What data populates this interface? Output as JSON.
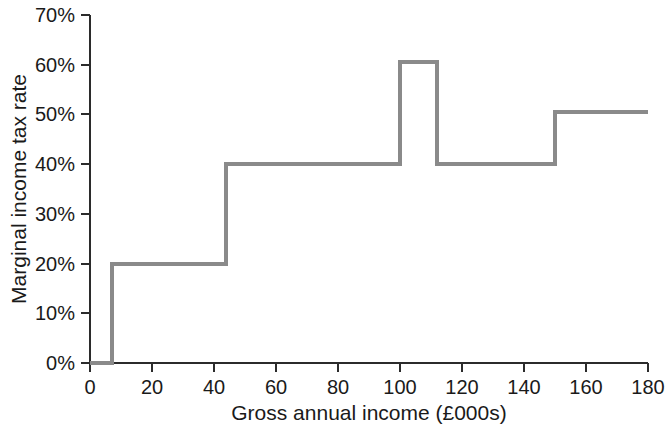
{
  "chart_data": {
    "type": "line",
    "subtype": "step",
    "title": "",
    "xlabel": "Gross annual income (£000s)",
    "ylabel": "Marginal income tax rate",
    "xlim": [
      0,
      180
    ],
    "ylim": [
      0,
      70
    ],
    "grid": false,
    "legend": false,
    "legend_position": "none",
    "x_ticks": [
      0,
      20,
      40,
      60,
      80,
      100,
      120,
      140,
      160,
      180
    ],
    "x_tick_labels": [
      "0",
      "20",
      "40",
      "60",
      "80",
      "100",
      "120",
      "140",
      "160",
      "180"
    ],
    "y_ticks": [
      0,
      10,
      20,
      30,
      40,
      50,
      60,
      70
    ],
    "y_tick_labels": [
      "0%",
      "10%",
      "20%",
      "30%",
      "40%",
      "50%",
      "60%",
      "70%"
    ],
    "series": [
      {
        "name": "Marginal income tax rate",
        "color": "#8a8a8a",
        "steps": [
          {
            "x_start": 0,
            "x_end": 7,
            "y": 0.0
          },
          {
            "x_start": 7,
            "x_end": 44,
            "y": 20.0
          },
          {
            "x_start": 44,
            "x_end": 100,
            "y": 40.0
          },
          {
            "x_start": 100,
            "x_end": 112,
            "y": 60.5
          },
          {
            "x_start": 112,
            "x_end": 150,
            "y": 40.0
          },
          {
            "x_start": 150,
            "x_end": 180,
            "y": 50.5
          }
        ]
      }
    ],
    "axis_color": "#2b2b2b",
    "background_color": "#ffffff"
  }
}
